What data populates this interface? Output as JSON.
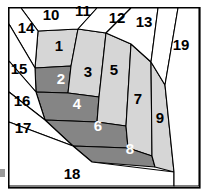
{
  "figure": {
    "width": 208,
    "height": 194,
    "background_color": "#ffffff",
    "border_color": "#000000",
    "colors": {
      "light_gray": "#d6d6d6",
      "dark_gray": "#858585",
      "white": "#ffffff",
      "outline": "#000000",
      "label_dark": "#000000",
      "label_light": "#ffffff",
      "edge_tick": "#9a9a9a"
    }
  },
  "regions": [
    {
      "id": "1",
      "label": "1",
      "shade": "light",
      "label_color": "dark",
      "x": 59,
      "y": 47,
      "points": "38,31 78,29 71,66 35,68"
    },
    {
      "id": "2",
      "label": "2",
      "shade": "dark",
      "label_color": "light",
      "x": 61,
      "y": 80,
      "points": "35,68 71,66 68,93 36,92"
    },
    {
      "id": "3",
      "label": "3",
      "shade": "light",
      "label_color": "dark",
      "x": 88,
      "y": 73,
      "points": "78,29 106,33 99,97 68,93 71,66"
    },
    {
      "id": "4",
      "label": "4",
      "shade": "dark",
      "label_color": "light",
      "x": 77,
      "y": 105,
      "points": "36,92 68,93 99,97 97,122 45,120"
    },
    {
      "id": "5",
      "label": "5",
      "shade": "light",
      "label_color": "dark",
      "x": 114,
      "y": 71,
      "points": "106,33 131,44 126,126 97,122 99,97"
    },
    {
      "id": "6",
      "label": "6",
      "shade": "dark",
      "label_color": "light",
      "x": 98,
      "y": 127,
      "points": "45,120 97,122 126,126 128,148 73,146"
    },
    {
      "id": "7",
      "label": "7",
      "shade": "light",
      "label_color": "dark",
      "x": 138,
      "y": 100,
      "points": "131,44 151,62 152,156 128,148 126,126"
    },
    {
      "id": "8",
      "label": "8",
      "shade": "dark",
      "label_color": "light",
      "x": 130,
      "y": 150,
      "points": "73,146 128,148 152,156 155,167 92,162"
    },
    {
      "id": "9",
      "label": "9",
      "shade": "light",
      "label_color": "dark",
      "x": 160,
      "y": 119,
      "points": "151,62 165,85 174,172 155,167 152,156"
    },
    {
      "id": "10",
      "label": "10",
      "shade": "white",
      "label_color": "dark",
      "x": 51,
      "y": 16,
      "points": "21,8 97,8 78,29 38,31"
    },
    {
      "id": "11",
      "label": "11",
      "shade": "white",
      "label_color": "dark",
      "x": 83,
      "y": 12,
      "points": "97,8 131,8 106,33 78,29"
    },
    {
      "id": "12",
      "label": "12",
      "shade": "white",
      "label_color": "dark",
      "x": 117,
      "y": 19,
      "points": "131,8 158,8 151,62 131,44 106,33"
    },
    {
      "id": "13",
      "label": "13",
      "shade": "white",
      "label_color": "dark",
      "x": 144,
      "y": 23,
      "points": "158,8 178,8 165,85 151,62"
    },
    {
      "id": "14",
      "label": "14",
      "shade": "white",
      "label_color": "dark",
      "x": 26,
      "y": 29,
      "points": "9,8 21,8 38,31 35,68 9,24"
    },
    {
      "id": "15",
      "label": "15",
      "shade": "white",
      "label_color": "dark",
      "x": 19,
      "y": 70,
      "points": "9,24 35,68 36,92 9,61"
    },
    {
      "id": "16",
      "label": "16",
      "shade": "white",
      "label_color": "dark",
      "x": 22,
      "y": 102,
      "points": "9,61 36,92 45,120 9,92"
    },
    {
      "id": "17",
      "label": "17",
      "shade": "white",
      "label_color": "dark",
      "x": 23,
      "y": 129,
      "points": "9,92 45,120 73,146 9,122"
    },
    {
      "id": "18",
      "label": "18",
      "shade": "white",
      "label_color": "dark",
      "x": 72,
      "y": 175,
      "points": "9,122 73,146 92,162 174,172 174,186 9,186"
    },
    {
      "id": "19",
      "label": "19",
      "shade": "white",
      "label_color": "dark",
      "x": 181,
      "y": 46,
      "points": "178,8 199,8 199,186 174,186 174,172 165,85"
    }
  ],
  "frame": {
    "x": 8,
    "y": 7,
    "width": 191,
    "height": 180
  },
  "edge_tick": {
    "x": 0,
    "y": 169,
    "width": 5,
    "height": 8
  }
}
